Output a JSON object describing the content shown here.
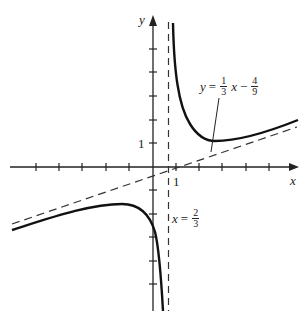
{
  "figure": {
    "axes": {
      "x_label": "x",
      "y_label": "y",
      "x_tick_label": "1",
      "y_tick_label": "1"
    },
    "asymptotes": {
      "vertical": {
        "label_var": "x",
        "eq": "=",
        "num": "2",
        "den": "3"
      },
      "oblique": {
        "label_var": "y",
        "eq": "=",
        "c1_num": "1",
        "c1_den": "3",
        "x": "x",
        "minus": "−",
        "c2_num": "4",
        "c2_den": "9"
      }
    },
    "colors": {
      "curve": "#111111",
      "axis": "#222222",
      "dash": "#333333"
    }
  }
}
